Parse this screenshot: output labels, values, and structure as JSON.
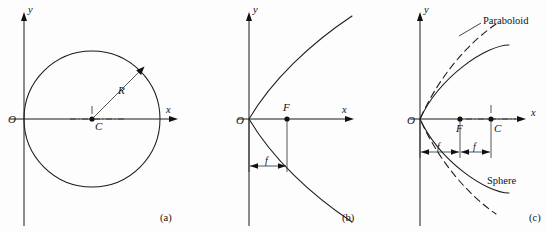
{
  "figure": {
    "background_color": "#fdfdfd",
    "ink_color": "#1b1b1b",
    "panels": [
      {
        "id": "a",
        "caption": "(a)",
        "subject": "circle tangent to y-axis at origin",
        "axis_x_label": "x",
        "axis_y_label": "y",
        "origin_label": "O",
        "center_label": "C",
        "radius_label": "R"
      },
      {
        "id": "b",
        "caption": "(b)",
        "subject": "parabola opening right with focus",
        "axis_x_label": "x",
        "axis_y_label": "y",
        "origin_label": "O",
        "focus_label": "F",
        "focal_length_label": "f"
      },
      {
        "id": "c",
        "caption": "(c)",
        "subject": "paraboloid compared with sphere",
        "axis_x_label": "x",
        "axis_y_label": "y",
        "origin_label": "O",
        "focus_label": "F",
        "center_label": "C",
        "focal_length_label_1": "f",
        "focal_length_label_2": "f",
        "curve_label_dashed": "Paraboloid",
        "curve_label_solid": "Sphere"
      }
    ]
  }
}
